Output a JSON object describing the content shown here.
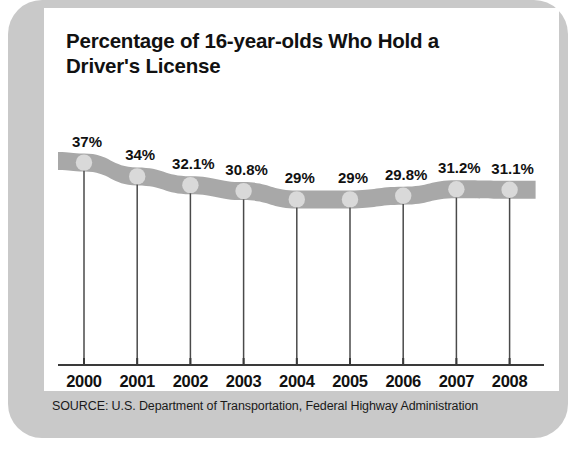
{
  "chart_data": {
    "type": "line",
    "title": "Percentage of 16-year-olds Who Hold a Driver's License",
    "xlabel": "",
    "ylabel": "",
    "grid": false,
    "legend": "none",
    "categories": [
      "2000",
      "2001",
      "2002",
      "2003",
      "2004",
      "2005",
      "2006",
      "2007",
      "2008"
    ],
    "values": [
      37,
      34,
      32.1,
      30.8,
      29,
      29,
      29.8,
      31.2,
      31.1
    ],
    "point_labels": [
      "37%",
      "34%",
      "32.1%",
      "30.8%",
      "29%",
      "29%",
      "29.8%",
      "31.2%",
      "31.1%"
    ],
    "ylim": [
      0,
      40
    ],
    "series": [
      {
        "name": "Percentage of 16-year-olds with a driver's license",
        "values": [
          37,
          34,
          32.1,
          30.8,
          29,
          29,
          29.8,
          31.2,
          31.1
        ]
      }
    ],
    "source": "SOURCE: U.S. Department of Transportation, Federal Highway Administration"
  },
  "colors": {
    "band": "#a8a8a8",
    "marker": "#d9d9d9",
    "frame": "#c9c9c9",
    "panel": "#ffffff",
    "text": "#111111",
    "axis": "#3a3a3a"
  }
}
